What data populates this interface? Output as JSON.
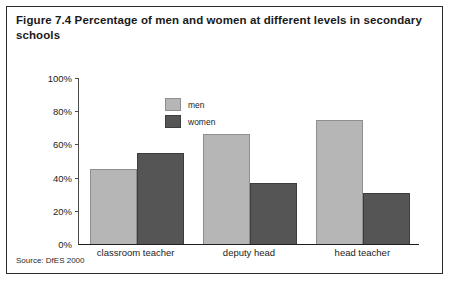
{
  "figure": {
    "caption": "Figure 7.4 Percentage of men and women at different levels in secondary schools",
    "source": "Source: DfES 2000"
  },
  "chart_data": {
    "type": "bar",
    "title": "Figure 7.4 Percentage of men and women at different levels in secondary schools",
    "xlabel": "",
    "ylabel": "",
    "categories": [
      "classroom teacher",
      "deputy head",
      "head teacher"
    ],
    "series": [
      {
        "name": "men",
        "color": "#b6b6b6",
        "values": [
          45,
          66,
          75
        ]
      },
      {
        "name": "women",
        "color": "#555555",
        "values": [
          55,
          37,
          31
        ]
      }
    ],
    "ylim": [
      0,
      100
    ],
    "yticks": [
      0,
      20,
      40,
      60,
      80,
      100
    ],
    "ytick_labels": [
      "0%",
      "20%",
      "40%",
      "60%",
      "80%",
      "100%"
    ],
    "grid": false,
    "legend_position": "top-left-inside",
    "value_unit": "%"
  }
}
